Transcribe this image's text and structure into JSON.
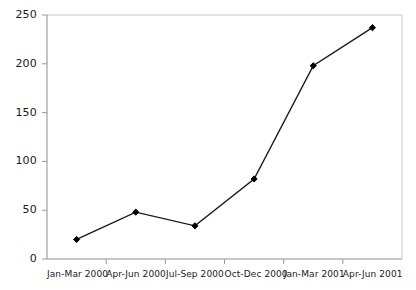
{
  "chart_data": {
    "type": "line",
    "title": "",
    "subtitle": "",
    "xlabel": "",
    "ylabel": "",
    "categories": [
      "Jan-Mar 2000",
      "Apr-Jun 2000",
      "Jul-Sep 2000",
      "Oct-Dec 2000",
      "Jan-Mar 2001",
      "Apr-Jun 2001"
    ],
    "values": [
      20,
      48,
      34,
      82,
      198,
      237
    ],
    "series": [
      {
        "name": "",
        "values": [
          20,
          48,
          34,
          82,
          198,
          237
        ]
      }
    ],
    "ylim": [
      0,
      250
    ],
    "yticks": [
      0,
      50,
      100,
      150,
      200,
      250
    ],
    "ytick_labels": [
      "0",
      "50",
      "100",
      "150",
      "200",
      "250"
    ],
    "xtick_labels": [
      "Jan-Mar 2000",
      "Apr-Jun 2000",
      "Jul-Sep 2000",
      "Oct-Dec 2000",
      "Jan-Mar 2001",
      "Apr-Jun 2001"
    ],
    "grid": false,
    "legend": false,
    "legend_position": "none",
    "marker": "diamond",
    "line_color": "#1a1a1a",
    "marker_color": "#000000",
    "axis_color": "#999999",
    "background_color": "#ffffff",
    "plot_border": [
      "top",
      "right",
      "bottom",
      "left"
    ]
  }
}
